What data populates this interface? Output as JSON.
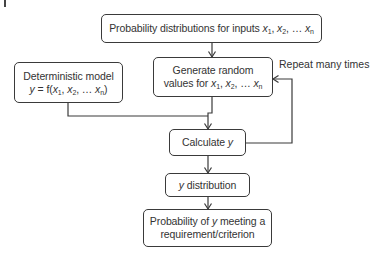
{
  "diagram": {
    "type": "flowchart",
    "nodes": {
      "inputs": {
        "text_prefix": "Probability distributions for inputs ",
        "vars": [
          "x",
          "1",
          "x",
          "2",
          "x",
          "n"
        ]
      },
      "model": {
        "line1": "Deterministic model",
        "line2_prefix": "y",
        "line2_eq": " = f(",
        "vars": [
          "x",
          "1",
          "x",
          "2",
          "x",
          "n"
        ],
        "line2_suffix": ")"
      },
      "generate": {
        "line1": "Generate random",
        "line2_prefix": "values for ",
        "vars": [
          "x",
          "1",
          "x",
          "2",
          "x",
          "n"
        ]
      },
      "calculate": {
        "text": "Calculate ",
        "var": "y"
      },
      "distribution": {
        "var": "y",
        "text": " distribution"
      },
      "probability": {
        "line1_prefix": "Probability of ",
        "line1_var": "y",
        "line1_suffix": " meeting a",
        "line2": "requirement/criterion"
      }
    },
    "separators": {
      "comma": ", ",
      "ellipsis": ", … "
    },
    "loop_label": "Repeat many times",
    "edges": [
      {
        "from": "inputs",
        "to": "generate"
      },
      {
        "from": "generate",
        "to": "calculate"
      },
      {
        "from": "model",
        "to": "calculate"
      },
      {
        "from": "calculate",
        "to": "generate",
        "label": "Repeat many times"
      },
      {
        "from": "calculate",
        "to": "distribution"
      },
      {
        "from": "distribution",
        "to": "probability"
      }
    ],
    "colors": {
      "stroke": "#3a3a3a",
      "text": "#333333",
      "background": "#ffffff"
    }
  }
}
